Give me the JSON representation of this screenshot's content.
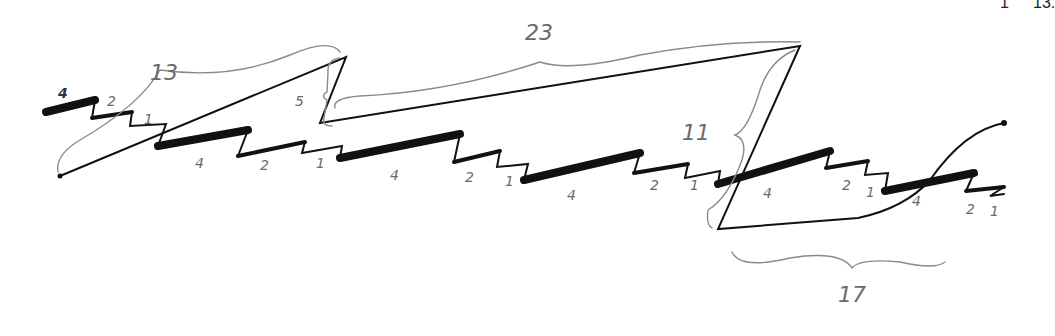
{
  "corner_text": {
    "left": "1",
    "right": "13."
  },
  "braces": {
    "b13": "13",
    "b23": "23",
    "b5": "5",
    "b11": "11",
    "b17": "17"
  },
  "steps": {
    "s0_4": "4",
    "s0_2": "2",
    "s0_1": "1",
    "s1_4": "4",
    "s1_2": "2",
    "s1_1": "1",
    "s2_4": "4",
    "s2_2": "2",
    "s2_1": "1",
    "s3_4": "4",
    "s3_2": "2",
    "s3_1": "1",
    "s4_4": "4",
    "s4_2": "2",
    "s4_1": "1",
    "s5_4": "4",
    "s5_2": "2",
    "s5_1": "1"
  },
  "colors": {
    "ink": "#111111",
    "pencil": "#8a8a8a",
    "paper": "#ffffff"
  }
}
